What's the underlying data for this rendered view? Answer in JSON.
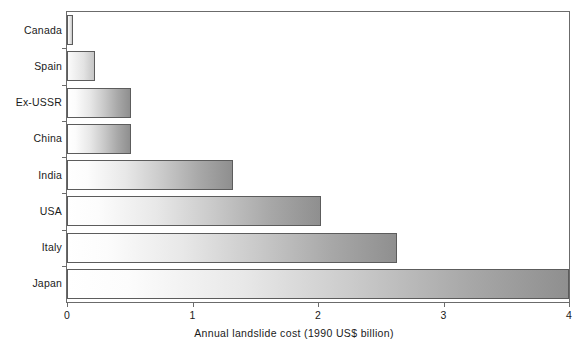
{
  "chart_data": {
    "type": "bar",
    "orientation": "horizontal",
    "title": "",
    "xlabel": "Annual landslide cost (1990 US$ billion)",
    "ylabel": "",
    "xlim": [
      0,
      4
    ],
    "xticks": [
      "0",
      "1",
      "2",
      "3",
      "4"
    ],
    "xtick_values": [
      0,
      1,
      2,
      3,
      4
    ],
    "grid": false,
    "legend": false,
    "categories": [
      "Canada",
      "Spain",
      "Ex-USSR",
      "China",
      "India",
      "USA",
      "Italy",
      "Japan"
    ],
    "values": [
      0.05,
      0.22,
      0.51,
      0.51,
      1.32,
      2.02,
      2.63,
      4.0
    ],
    "bars": [
      {
        "label": "Canada",
        "value": 0.05
      },
      {
        "label": "Spain",
        "value": 0.22
      },
      {
        "label": "Ex-USSR",
        "value": 0.51
      },
      {
        "label": "China",
        "value": 0.51
      },
      {
        "label": "India",
        "value": 1.32
      },
      {
        "label": "USA",
        "value": 2.02
      },
      {
        "label": "Italy",
        "value": 2.63
      },
      {
        "label": "Japan",
        "value": 4.0
      }
    ],
    "colors": {
      "bar_gradient_start": "#ffffff",
      "bar_gradient_end": "#8f8f8f",
      "bar_border": "#5c5c5c",
      "axis": "#6b6b6b",
      "text": "#1a1a1a",
      "background": "#ffffff"
    }
  }
}
